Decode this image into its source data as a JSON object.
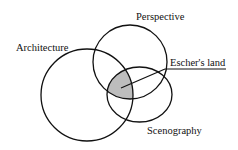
{
  "diagram": {
    "type": "venn",
    "sets": [
      {
        "id": "architecture",
        "label": "Architecture"
      },
      {
        "id": "perspective",
        "label": "Perspective"
      },
      {
        "id": "scenography",
        "label": "Scenography"
      }
    ],
    "intersection": {
      "sets": [
        "architecture",
        "perspective",
        "scenography"
      ],
      "label": "Escher's land",
      "fill": "#bdbdbd"
    },
    "stroke_color": "#111111"
  }
}
